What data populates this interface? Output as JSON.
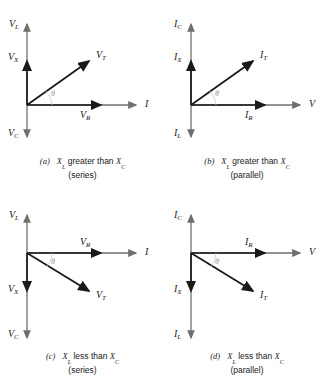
{
  "figure": {
    "background": "#ffffff",
    "axis_color": "#6f6f6f",
    "vector_color": "#1a1a1a",
    "theta_color": "#9a9a9a",
    "theta_symbol": "θ"
  },
  "panels": [
    {
      "id": "a",
      "tag": "(a)",
      "caption_line1_prefix": "X",
      "caption_line1_sub1": "L",
      "caption_line1_mid": " greater than ",
      "caption_line1_sub2": "C",
      "caption_line2": "(series)",
      "vertical_axis_top_label": "V",
      "vertical_axis_top_sub": "L",
      "vertical_axis_mid_label": "V",
      "vertical_axis_mid_sub": "X",
      "vertical_axis_bottom_label": "V",
      "vertical_axis_bottom_sub": "C",
      "horizontal_axis_label": "I",
      "horizontal_axis_sub": "",
      "resultant_label": "V",
      "resultant_sub": "T",
      "resistive_label": "V",
      "resistive_sub": "R",
      "angle_label": "θ",
      "resultant_direction": "up-right"
    },
    {
      "id": "b",
      "tag": "(b)",
      "caption_line1_prefix": "X",
      "caption_line1_sub1": "L",
      "caption_line1_mid": " greater than ",
      "caption_line1_sub2": "C",
      "caption_line2": "(parallel)",
      "vertical_axis_top_label": "I",
      "vertical_axis_top_sub": "C",
      "vertical_axis_mid_label": "I",
      "vertical_axis_mid_sub": "X",
      "vertical_axis_bottom_label": "I",
      "vertical_axis_bottom_sub": "L",
      "horizontal_axis_label": "V",
      "horizontal_axis_sub": "",
      "resultant_label": "I",
      "resultant_sub": "T",
      "resistive_label": "I",
      "resistive_sub": "R",
      "angle_label": "θ",
      "resultant_direction": "up-right"
    },
    {
      "id": "c",
      "tag": "(c)",
      "caption_line1_prefix": "X",
      "caption_line1_sub1": "L",
      "caption_line1_mid": " less than ",
      "caption_line1_sub2": "C",
      "caption_line2": "(series)",
      "vertical_axis_top_label": "V",
      "vertical_axis_top_sub": "L",
      "vertical_axis_mid_label": "V",
      "vertical_axis_mid_sub": "X",
      "vertical_axis_bottom_label": "V",
      "vertical_axis_bottom_sub": "C",
      "horizontal_axis_label": "I",
      "horizontal_axis_sub": "",
      "resultant_label": "V",
      "resultant_sub": "T",
      "resistive_label": "V",
      "resistive_sub": "R",
      "angle_label": "θ",
      "resultant_direction": "down-right"
    },
    {
      "id": "d",
      "tag": "(d)",
      "caption_line1_prefix": "X",
      "caption_line1_sub1": "L",
      "caption_line1_mid": " less than ",
      "caption_line1_sub2": "C",
      "caption_line2": "(parallel)",
      "vertical_axis_top_label": "I",
      "vertical_axis_top_sub": "C",
      "vertical_axis_mid_label": "I",
      "vertical_axis_mid_sub": "X",
      "vertical_axis_bottom_label": "I",
      "vertical_axis_bottom_sub": "L",
      "horizontal_axis_label": "V",
      "horizontal_axis_sub": "",
      "resultant_label": "I",
      "resultant_sub": "T",
      "resistive_label": "I",
      "resistive_sub": "R",
      "angle_label": "θ",
      "resultant_direction": "down-right"
    }
  ]
}
